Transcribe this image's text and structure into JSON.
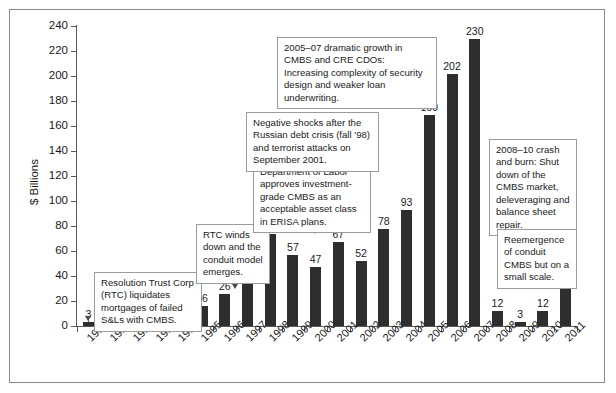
{
  "chart_data": {
    "type": "bar",
    "title": "",
    "subtitle": "",
    "xlabel": "",
    "ylabel": "$ Billions",
    "ylim": [
      0,
      240
    ],
    "ytick_step": 20,
    "yticks": [
      0,
      20,
      40,
      60,
      80,
      100,
      120,
      140,
      160,
      180,
      200,
      220,
      240
    ],
    "grid": false,
    "legend": null,
    "bar_color": "#2e2e2e",
    "categories": [
      "1990",
      "1991",
      "1992",
      "1993",
      "1994",
      "1995",
      "1996",
      "1997",
      "1998",
      "1999",
      "2000",
      "2001",
      "2002",
      "2003",
      "2004",
      "2005",
      "2006",
      "2007",
      "2008",
      "2009",
      "2010",
      "2011"
    ],
    "values": [
      3,
      8,
      14,
      17,
      17,
      16,
      26,
      37,
      74,
      57,
      47,
      67,
      52,
      78,
      93,
      169,
      202,
      230,
      12,
      3,
      12,
      33
    ],
    "annotations": [
      {
        "id": "resolution-trust",
        "text": "Resolution Trust Corp (RTC) liquidates mortgages of failed S&Ls with CMBS.",
        "points_to": "1990"
      },
      {
        "id": "rtc-winds-down",
        "text": "RTC winds down and the conduit model emerges.",
        "points_to": "1997"
      },
      {
        "id": "department-of-labor",
        "text": "Department of Labor approves investment-grade CMBS as an acceptable asset class in ERISA plans.",
        "points_to": "2000"
      },
      {
        "id": "negative-shocks",
        "text": "Negative shocks after the Russian debt crisis (fall '98) and terrorist attacks on September 2001.",
        "points_to": "1999, 2002"
      },
      {
        "id": "dramatic-growth",
        "text": "2005–07 dramatic growth in CMBS and CRE CDOs: Increasing complexity of security design and weaker loan underwriting.",
        "points_to": "2007"
      },
      {
        "id": "crash-and-burn",
        "text": "2008–10 crash and burn: Shut down of the CMBS market, deleveraging and balance sheet repair.",
        "points_to": "2008-2010"
      },
      {
        "id": "reemergence",
        "text": "Reemergence of conduit CMBS but on a small scale.",
        "points_to": "2011"
      }
    ]
  },
  "axis": {
    "y_label": "$ Billions",
    "y_ticks": [
      "240",
      "220",
      "200",
      "180",
      "160",
      "140",
      "120",
      "100",
      "80",
      "60",
      "40",
      "20",
      "0"
    ],
    "x_ticks": [
      "1990",
      "1991",
      "1992",
      "1993",
      "1994",
      "1995",
      "1996",
      "1997",
      "1998",
      "1999",
      "2000",
      "2001",
      "2002",
      "2003",
      "2004",
      "2005",
      "2006",
      "2007",
      "2008",
      "2009",
      "2010",
      "2011"
    ]
  },
  "bar_labels": [
    "3",
    "8",
    "14",
    "17",
    "17",
    "16",
    "26",
    "37",
    "74",
    "57",
    "47",
    "67",
    "52",
    "78",
    "93",
    "169",
    "202",
    "230",
    "12",
    "3",
    "12",
    "33"
  ],
  "callouts": {
    "resolution_trust": "Resolution Trust Corp (RTC) liquidates mortgages of failed S&Ls with CMBS.",
    "rtc_winds_down": "RTC winds down and the conduit model emerges.",
    "department_of_labor": "Department of Labor approves investment-grade CMBS as an acceptable asset class in ERISA plans.",
    "negative_shocks": "Negative shocks after the Russian debt crisis (fall '98) and terrorist attacks on September 2001.",
    "dramatic_growth": "2005–07 dramatic growth in CMBS and CRE CDOs: Increasing complexity of security design and weaker loan underwriting.",
    "crash_and_burn": "2008–10 crash and burn: Shut down of the CMBS market, deleveraging and balance sheet repair.",
    "reemergence": "Reemergence of conduit CMBS but on a small scale."
  }
}
